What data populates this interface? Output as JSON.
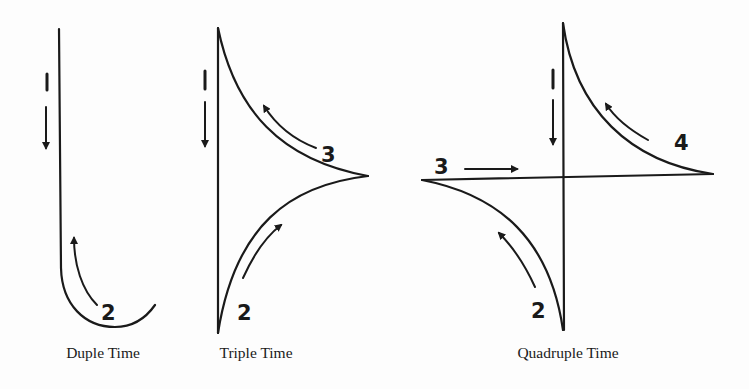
{
  "diagrams": [
    {
      "id": "duple",
      "caption": "Duple Time",
      "beats": [
        {
          "label": "1",
          "direction": "down"
        },
        {
          "label": "2",
          "direction": "up-left curve"
        }
      ]
    },
    {
      "id": "triple",
      "caption": "Triple Time",
      "beats": [
        {
          "label": "1",
          "direction": "down"
        },
        {
          "label": "2",
          "direction": "up-right curve"
        },
        {
          "label": "3",
          "direction": "up-left curve"
        }
      ]
    },
    {
      "id": "quadruple",
      "caption": "Quadruple Time",
      "beats": [
        {
          "label": "1",
          "direction": "down"
        },
        {
          "label": "2",
          "direction": "up-left curve"
        },
        {
          "label": "3",
          "direction": "right"
        },
        {
          "label": "4",
          "direction": "up-left curve"
        }
      ]
    }
  ],
  "colors": {
    "ink": "#1a1a1a",
    "paper": "#fdfdfd"
  }
}
